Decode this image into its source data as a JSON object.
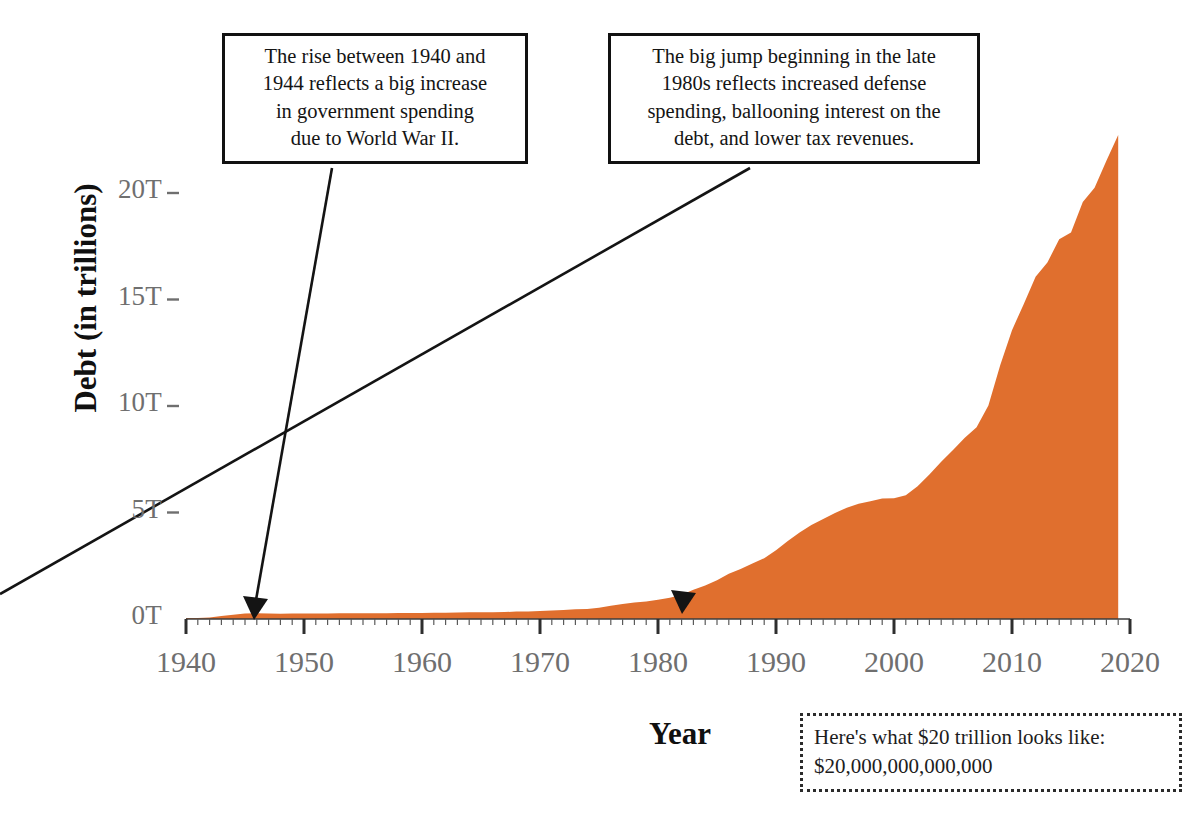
{
  "chart_data": {
    "type": "area",
    "title": "",
    "xlabel": "Year",
    "ylabel": "Debt (in trillions)",
    "xlim": [
      1940,
      2020
    ],
    "ylim": [
      0,
      23
    ],
    "grid": false,
    "legend": "none",
    "series_color": "#E06F2E",
    "x_tick_labels": [
      "1940",
      "1950",
      "1960",
      "1970",
      "1980",
      "1990",
      "2000",
      "2010",
      "2020"
    ],
    "x_tick_values": [
      1940,
      1950,
      1960,
      1970,
      1980,
      1990,
      2000,
      2010,
      2020
    ],
    "x_minor_tick_interval": 1,
    "y_tick_labels": [
      "0T",
      "5T",
      "10T",
      "15T",
      "20T"
    ],
    "y_tick_values": [
      0,
      5,
      10,
      15,
      20
    ],
    "series": [
      {
        "name": "U.S. National Debt",
        "x": [
          1940,
          1941,
          1942,
          1943,
          1944,
          1945,
          1946,
          1947,
          1948,
          1949,
          1950,
          1951,
          1952,
          1953,
          1954,
          1955,
          1956,
          1957,
          1958,
          1959,
          1960,
          1961,
          1962,
          1963,
          1964,
          1965,
          1966,
          1967,
          1968,
          1969,
          1970,
          1971,
          1972,
          1973,
          1974,
          1975,
          1976,
          1977,
          1978,
          1979,
          1980,
          1981,
          1982,
          1983,
          1984,
          1985,
          1986,
          1987,
          1988,
          1989,
          1990,
          1991,
          1992,
          1993,
          1994,
          1995,
          1996,
          1997,
          1998,
          1999,
          2000,
          2001,
          2002,
          2003,
          2004,
          2005,
          2006,
          2007,
          2008,
          2009,
          2010,
          2011,
          2012,
          2013,
          2014,
          2015,
          2016,
          2017,
          2018,
          2019
        ],
        "values": [
          0.043,
          0.049,
          0.072,
          0.137,
          0.201,
          0.259,
          0.269,
          0.258,
          0.252,
          0.253,
          0.257,
          0.255,
          0.259,
          0.266,
          0.271,
          0.274,
          0.273,
          0.271,
          0.276,
          0.285,
          0.287,
          0.289,
          0.298,
          0.306,
          0.312,
          0.317,
          0.32,
          0.326,
          0.348,
          0.354,
          0.371,
          0.398,
          0.427,
          0.458,
          0.475,
          0.533,
          0.62,
          0.699,
          0.772,
          0.827,
          0.908,
          0.998,
          1.142,
          1.377,
          1.572,
          1.823,
          2.125,
          2.35,
          2.602,
          2.857,
          3.233,
          3.665,
          4.065,
          4.411,
          4.693,
          4.974,
          5.225,
          5.413,
          5.526,
          5.656,
          5.674,
          5.807,
          6.228,
          6.783,
          7.379,
          7.933,
          8.507,
          9.008,
          10.025,
          11.91,
          13.562,
          14.79,
          16.066,
          16.738,
          17.824,
          18.151,
          19.573,
          20.245,
          21.516,
          22.719
        ]
      }
    ],
    "annotations": [
      {
        "id": "wwii",
        "lines": [
          "The rise between 1940 and",
          "1944 reflects a big increase",
          "in government spending",
          "due to World War II."
        ],
        "points_to_year": 1943
      },
      {
        "id": "late-1980s",
        "lines": [
          "The big jump beginning in the late",
          "1980s reflects increased defense",
          "spending, ballooning interest on the",
          "debt, and lower tax revenues."
        ],
        "points_to_year": 1980
      }
    ],
    "footnote": {
      "lines": [
        "Here's what $20 trillion looks like:",
        "$20,000,000,000,000"
      ]
    }
  }
}
